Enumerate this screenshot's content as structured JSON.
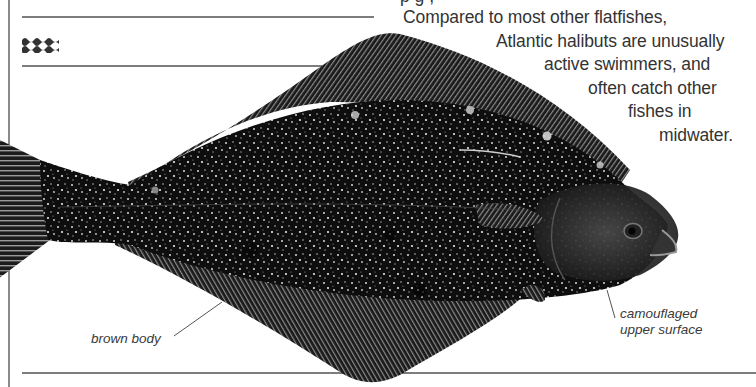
{
  "page": {
    "description_lines": [
      "Compared to most other flatfishes,",
      "Atlantic halibuts are unusually",
      "active swimmers, and",
      "often catch other",
      "fishes in",
      "midwater."
    ],
    "cut_off_line": "p                   g  ,",
    "section_icon": "waves-icon"
  },
  "illustration": {
    "subject": "Atlantic halibut",
    "labels": {
      "brown_body": "brown body",
      "camouflaged_line1": "camouflaged",
      "camouflaged_line2": "upper surface"
    }
  },
  "colors": {
    "rule": "#7d7d7d",
    "text": "#333333",
    "fish_dark": "#111111",
    "fin": "#2b2b2b",
    "speckle": "#e8e8e8"
  }
}
